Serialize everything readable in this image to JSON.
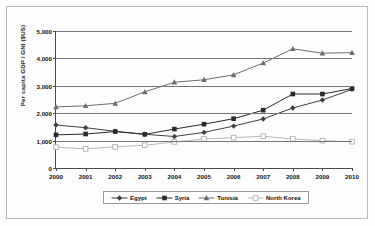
{
  "figure": {
    "scan_artifact": "· ·",
    "frame_border_color": "#b9b9b9",
    "plot_background": "#fdfdfd"
  },
  "chart_data": {
    "type": "line",
    "title": "",
    "subtitle": "",
    "xlabel": "",
    "ylabel": "Per capita GDP / GNI ($US)",
    "x": [
      "2000",
      "2001",
      "2002",
      "2003",
      "2004",
      "2005",
      "2006",
      "2007",
      "2008",
      "2009",
      "2010"
    ],
    "categories": [
      "2000",
      "2001",
      "2002",
      "2003",
      "2004",
      "2005",
      "2006",
      "2007",
      "2008",
      "2009",
      "2010"
    ],
    "ylim": [
      0,
      5000
    ],
    "ytick_labels": [
      "0",
      "1,000",
      "2,000",
      "3,000",
      "4,000",
      "5,000"
    ],
    "ytick_values": [
      0,
      1000,
      2000,
      3000,
      4000,
      5000
    ],
    "grid": "horizontal",
    "legend_position": "bottom",
    "series": [
      {
        "name": "Egypt",
        "marker": "diamond",
        "color": "#404040",
        "values": [
          1570,
          1470,
          1340,
          1230,
          1150,
          1300,
          1530,
          1790,
          2190,
          2480,
          2870
        ]
      },
      {
        "name": "Syria",
        "marker": "square",
        "color": "#2a2a2a",
        "values": [
          1210,
          1240,
          1330,
          1230,
          1420,
          1600,
          1800,
          2110,
          2700,
          2700,
          2900
        ]
      },
      {
        "name": "Tunisia",
        "marker": "triangle",
        "color": "#6e6e6e",
        "values": [
          2230,
          2270,
          2360,
          2780,
          3130,
          3220,
          3400,
          3830,
          4350,
          4190,
          4210
        ]
      },
      {
        "name": "North Korea",
        "marker": "open-square",
        "color": "#b0b0b0",
        "values": [
          760,
          700,
          770,
          830,
          950,
          1060,
          1110,
          1160,
          1060,
          1000,
          960
        ]
      }
    ]
  },
  "legend": {
    "items": [
      {
        "label": "Egypt"
      },
      {
        "label": "Syria"
      },
      {
        "label": "Tunisia"
      },
      {
        "label": "North Korea"
      }
    ]
  }
}
